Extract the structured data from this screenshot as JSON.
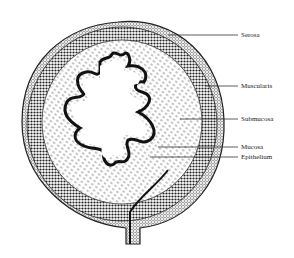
{
  "figure": {
    "labels": [
      {
        "id": "serosa",
        "text": "Serosa",
        "x": 241,
        "y": 31,
        "line_from": [
          168,
          35
        ],
        "line_to": [
          238,
          35
        ]
      },
      {
        "id": "muscularis",
        "text": "Muscularis",
        "x": 241,
        "y": 84,
        "line_from": [
          205,
          86
        ],
        "line_to": [
          238,
          86
        ]
      },
      {
        "id": "submucosa",
        "text": "Submucosa",
        "x": 241,
        "y": 117,
        "line_from": [
          180,
          119
        ],
        "line_to": [
          238,
          119
        ]
      },
      {
        "id": "mucosa",
        "text": "Mucosa",
        "x": 241,
        "y": 144,
        "line_from": [
          158,
          147
        ],
        "line_to": [
          238,
          147
        ]
      },
      {
        "id": "epithelium",
        "text": "Epithelium",
        "x": 241,
        "y": 154,
        "line_from": [
          150,
          157
        ],
        "line_to": [
          238,
          157
        ]
      }
    ]
  }
}
